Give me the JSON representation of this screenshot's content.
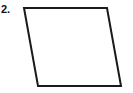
{
  "figure": {
    "label": "2.",
    "shape_name": "parallelogram",
    "canvas": {
      "width": 133,
      "height": 93
    },
    "background_color": "#ffffff",
    "stroke_color": "#1a1a1a",
    "fill_color": "#ffffff",
    "stroke_width": 2,
    "vertices": [
      {
        "name": "top-left",
        "x": 24,
        "y": 8
      },
      {
        "name": "top-right",
        "x": 107,
        "y": 8
      },
      {
        "name": "bottom-right",
        "x": 121,
        "y": 86
      },
      {
        "name": "bottom-left",
        "x": 38,
        "y": 86
      }
    ],
    "points_attr": "24,8 107,8 121,86 38,86"
  }
}
